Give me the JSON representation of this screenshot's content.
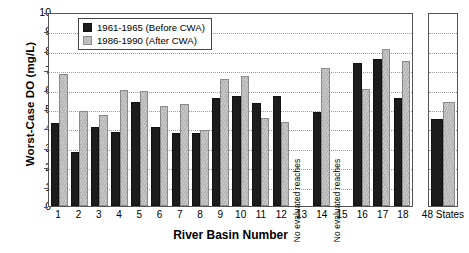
{
  "chart_data": {
    "type": "bar",
    "title": "",
    "xlabel": "River Basin Number",
    "ylabel": "Worst-Case DO (mg/L)",
    "ylim": [
      0,
      10
    ],
    "yticks": [
      0,
      1,
      2,
      3,
      4,
      5,
      6,
      7,
      8,
      9,
      10
    ],
    "grid": true,
    "legend_position": "top-left-inside",
    "categories": [
      "1",
      "2",
      "3",
      "4",
      "5",
      "6",
      "7",
      "8",
      "9",
      "10",
      "11",
      "12",
      "13",
      "14",
      "15",
      "16",
      "17",
      "18"
    ],
    "extra_category": "48 States",
    "series": [
      {
        "name": "1961-1965 (Before CWA)",
        "color": "#1c1c1c",
        "values": [
          4.3,
          2.8,
          4.1,
          3.85,
          5.4,
          4.1,
          3.8,
          3.8,
          5.65,
          5.75,
          5.35,
          5.75,
          null,
          4.9,
          null,
          7.45,
          7.65,
          5.6
        ],
        "extra_value": 4.55
      },
      {
        "name": "1986-1990 (After CWA)",
        "color": "#c0c0c0",
        "values": [
          6.9,
          4.95,
          4.75,
          6.05,
          6.0,
          5.2,
          5.3,
          3.95,
          6.6,
          6.75,
          4.6,
          4.35,
          null,
          7.2,
          null,
          6.1,
          8.2,
          7.55
        ],
        "extra_value": 5.4
      }
    ],
    "annotations": [
      {
        "category": "13",
        "text": "No evaluated reaches",
        "rotation": -90
      },
      {
        "category": "15",
        "text": "No evaluated reaches",
        "rotation": -90
      }
    ]
  }
}
